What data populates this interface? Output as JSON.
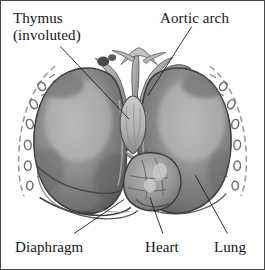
{
  "figure": {
    "kind": "anatomical-illustration",
    "style": "grayscale pen-and-wash drawing",
    "background_color": "#ffffff",
    "border_color": "#4a4a4a",
    "ink_color": "#141414"
  },
  "labels": {
    "thymus": {
      "line1": "Thymus",
      "line2": "(involuted)"
    },
    "aortic_arch": "Aortic arch",
    "diaphragm": "Diaphragm",
    "heart": "Heart",
    "lung": "Lung"
  },
  "leader_lines": [
    {
      "name": "thymus-leader",
      "from": [
        60,
        46
      ],
      "to": [
        129,
        119
      ]
    },
    {
      "name": "aortic-arch-leader",
      "from": [
        192,
        26
      ],
      "to": [
        148,
        95
      ]
    },
    {
      "name": "diaphragm-leader",
      "from": [
        74,
        234
      ],
      "to": [
        124,
        200
      ]
    },
    {
      "name": "heart-leader",
      "from": [
        163,
        234
      ],
      "to": [
        150,
        198
      ]
    },
    {
      "name": "lung-leader",
      "from": [
        228,
        234
      ],
      "to": [
        196,
        176
      ]
    }
  ],
  "structures": [
    {
      "name": "left-lung",
      "tone": "#8d8d8d"
    },
    {
      "name": "right-lung",
      "tone": "#8d8d8d"
    },
    {
      "name": "heart",
      "tone": "#9a9a9a"
    },
    {
      "name": "thymus",
      "tone": "#c3c3c3"
    },
    {
      "name": "great-vessels",
      "tone": "#b5b5b5"
    },
    {
      "name": "diaphragm",
      "tone": "#7f7f7f"
    },
    {
      "name": "rib-arc-left",
      "tone": "#9b9b9b"
    },
    {
      "name": "rib-arc-right",
      "tone": "#9b9b9b"
    }
  ]
}
